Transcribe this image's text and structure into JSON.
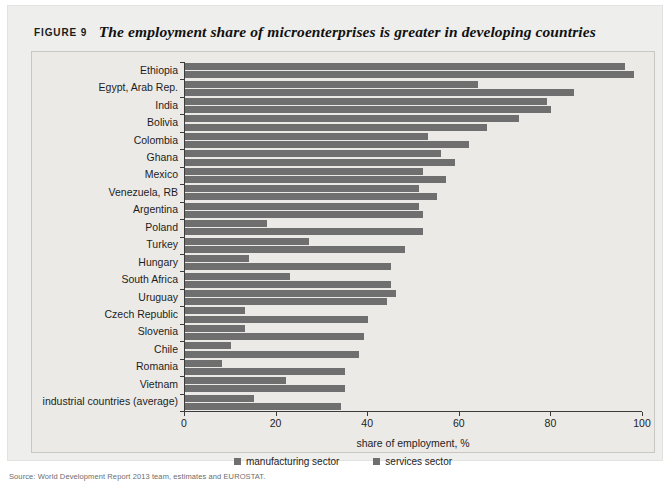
{
  "figure": {
    "label": "FIGURE 9",
    "headline": "The employment share of microenterprises is greater in developing countries",
    "source_note": "Source: World Development Report 2013 team, estimates and EUROSTAT."
  },
  "legend": {
    "items": [
      {
        "label": "manufacturing sector",
        "color": "#6f6f6f"
      },
      {
        "label": "services sector",
        "color": "#6f6f6f"
      }
    ]
  },
  "axis": {
    "x_title": "share of employment, %",
    "x_ticks": [
      "0",
      "20",
      "40",
      "60",
      "80",
      "100"
    ]
  },
  "chart_data": {
    "type": "bar",
    "orientation": "horizontal",
    "title": "The employment share of microenterprises is greater in developing countries",
    "xlabel": "share of employment, %",
    "ylabel": "",
    "xlim": [
      0,
      100
    ],
    "xticks": [
      0,
      20,
      40,
      60,
      80,
      100
    ],
    "grid": false,
    "legend_position": "bottom-center",
    "categories": [
      "Ethiopia",
      "Egypt, Arab Rep.",
      "India",
      "Bolivia",
      "Colombia",
      "Ghana",
      "Mexico",
      "Venezuela, RB",
      "Argentina",
      "Poland",
      "Turkey",
      "Hungary",
      "South Africa",
      "Uruguay",
      "Czech Republic",
      "Slovenia",
      "Chile",
      "Romania",
      "Vietnam",
      "industrial countries (average)"
    ],
    "series": [
      {
        "name": "manufacturing sector",
        "color": "#6f6f6f",
        "values": [
          96,
          64,
          79,
          73,
          53,
          56,
          52,
          51,
          51,
          18,
          27,
          14,
          23,
          46,
          13,
          13,
          10,
          8,
          22,
          15
        ]
      },
      {
        "name": "services sector",
        "color": "#6f6f6f",
        "values": [
          98,
          85,
          80,
          66,
          62,
          59,
          57,
          55,
          52,
          52,
          48,
          45,
          45,
          44,
          40,
          39,
          38,
          35,
          35,
          34
        ]
      }
    ]
  }
}
